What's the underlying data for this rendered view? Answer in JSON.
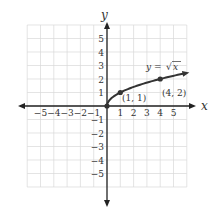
{
  "chart_data": {
    "type": "line",
    "title": "",
    "xlabel": "x",
    "ylabel": "y",
    "xlim": [
      -6,
      6
    ],
    "ylim": [
      -6,
      6
    ],
    "grid": true,
    "x_ticks": [
      "-5",
      "-4",
      "-3",
      "-2",
      "-1",
      "1",
      "2",
      "3",
      "4",
      "5"
    ],
    "y_ticks": [
      "5",
      "4",
      "3",
      "2",
      "1",
      "-1",
      "-2",
      "-3",
      "-4",
      "-5"
    ],
    "series": [
      {
        "name": "y = √x",
        "function": "sqrt",
        "x": [
          0,
          0.25,
          1,
          2,
          3,
          4,
          5,
          5.9
        ],
        "values": [
          0,
          0.5,
          1,
          1.414,
          1.732,
          2,
          2.236,
          2.429
        ]
      }
    ],
    "annotations": [
      {
        "text": "y = √x",
        "x": 3.6,
        "y": 2.9
      },
      {
        "text": "(1, 1)",
        "x": 1.1,
        "y": 0.6,
        "point": [
          1,
          1
        ]
      },
      {
        "text": "(4, 2)",
        "x": 4.0,
        "y": 1.6,
        "point": [
          4,
          2
        ]
      }
    ],
    "points": [
      [
        0,
        0
      ],
      [
        1,
        1
      ],
      [
        4,
        2
      ]
    ]
  },
  "labels": {
    "x_axis": "x",
    "y_axis": "y",
    "equation_prefix": "y = ",
    "equation_radicand": "x",
    "point_a": "(1, 1)",
    "point_b": "(4, 2)"
  },
  "colors": {
    "curve": "#333333",
    "axes": "#222222",
    "grid": "#d8d8d8"
  }
}
